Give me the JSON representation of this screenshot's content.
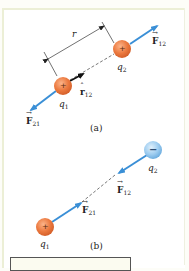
{
  "figure": {
    "colors": {
      "positive_charge": "#e9783e",
      "negative_charge": "#8fc3ea",
      "force_arrow": "#3a8fd6",
      "dashed_line": "#555555",
      "panel_border": "#ecefd6"
    },
    "panel_a": {
      "caption": "(a)",
      "charge_1": {
        "symbol": "+",
        "label_var": "q",
        "label_sub": "1"
      },
      "charge_2": {
        "symbol": "+",
        "label_var": "q",
        "label_sub": "2"
      },
      "distance_label": "r",
      "unit_vector": {
        "var": "r",
        "sub": "12"
      },
      "force_12": {
        "var": "F",
        "sub": "12"
      },
      "force_21": {
        "var": "F",
        "sub": "21"
      }
    },
    "panel_b": {
      "caption": "(b)",
      "charge_1": {
        "symbol": "+",
        "label_var": "q",
        "label_sub": "1"
      },
      "charge_2": {
        "symbol": "−",
        "label_var": "q",
        "label_sub": "2"
      },
      "force_12": {
        "var": "F",
        "sub": "12"
      },
      "force_21": {
        "var": "F",
        "sub": "21"
      }
    }
  }
}
